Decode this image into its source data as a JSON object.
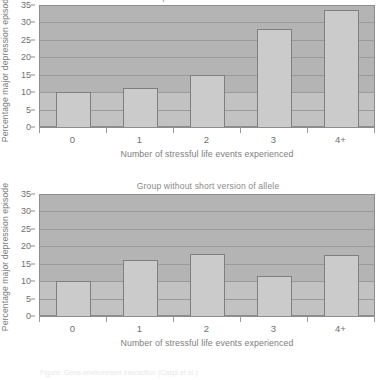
{
  "figure": {
    "caption": "Figure: Gene-environment interaction (Caspi et al.)",
    "axis": {
      "ylabel": "Percentage major depression episode",
      "xlabel": "Number of stressful life events experienced",
      "yticks": [
        0,
        5,
        10,
        15,
        20,
        25,
        30,
        35
      ],
      "categories": [
        "0",
        "1",
        "2",
        "3",
        "4+"
      ]
    },
    "colors": {
      "plot_background": "#b4b4b4",
      "plot_background_low": "#c2c2c2",
      "bar_fill": "#cbcbcb",
      "bar_stroke": "#7f7f7f",
      "gridline": "#9a9a9a",
      "axis": "#8d8d8d",
      "text": "#6f6f6f"
    }
  },
  "chart_data": [
    {
      "type": "bar",
      "title": "Group with short version of allele",
      "categories": [
        "0",
        "1",
        "2",
        "3",
        "4+"
      ],
      "values": [
        10.1,
        11.2,
        14.8,
        28.0,
        33.5
      ],
      "xlabel": "Number of stressful life events experienced",
      "ylabel": "Percentage major depression episode",
      "ylim": [
        0,
        35
      ],
      "yticks": [
        0,
        5,
        10,
        15,
        20,
        25,
        30,
        35
      ],
      "grid": true,
      "legend": "none"
    },
    {
      "type": "bar",
      "title": "Group without short version of allele",
      "categories": [
        "0",
        "1",
        "2",
        "3",
        "4+"
      ],
      "values": [
        10.1,
        16.1,
        17.9,
        11.4,
        17.5
      ],
      "xlabel": "Number of stressful life events experienced",
      "ylabel": "Percentage major depression episode",
      "ylim": [
        0,
        35
      ],
      "yticks": [
        0,
        5,
        10,
        15,
        20,
        25,
        30,
        35
      ],
      "grid": true,
      "legend": "none"
    }
  ]
}
